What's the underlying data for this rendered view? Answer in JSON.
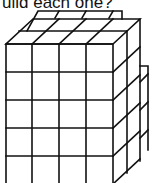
{
  "caption": {
    "text": "uild each one?"
  },
  "figure": {
    "name": "cube-stack",
    "front_columns": 4,
    "front_rows": 5,
    "depth": 2,
    "line_color": "#111111",
    "background": "#ffffff"
  }
}
